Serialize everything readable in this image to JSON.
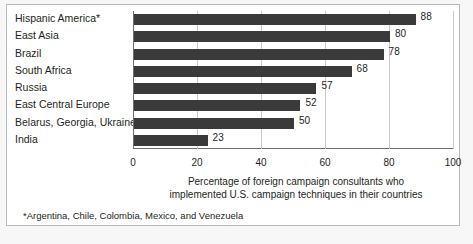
{
  "chart_data": {
    "type": "bar",
    "orientation": "horizontal",
    "title": "",
    "subtitle": "",
    "categories": [
      "Hispanic America*",
      "East Asia",
      "Brazil",
      "South Africa",
      "Russia",
      "East Central Europe",
      "Belarus, Georgia, Ukraine",
      "India"
    ],
    "values": [
      88,
      80,
      78,
      68,
      57,
      52,
      50,
      23
    ],
    "xlabel": "Percentage of foreign campaign consultants who implemented U.S. campaign techniques in their countries",
    "ylabel": "",
    "xlim": [
      0,
      100
    ],
    "xticks": [
      0,
      20,
      40,
      60,
      80,
      100
    ],
    "xtick_labels": [
      "0",
      "20",
      "40",
      "60",
      "80",
      "100"
    ],
    "grid": "vertical",
    "legend": "none",
    "bar_color": "#3a3a3a",
    "gridline_color": "#c9c9c9",
    "axis_color": "#6d6d6d"
  },
  "caption": {
    "line1": "Percentage of foreign campaign consultants who",
    "line2": "implemented U.S. campaign techniques in their countries"
  },
  "footnote": {
    "text": "*Argentina, Chile, Colombia, Mexico, and Venezuela"
  }
}
